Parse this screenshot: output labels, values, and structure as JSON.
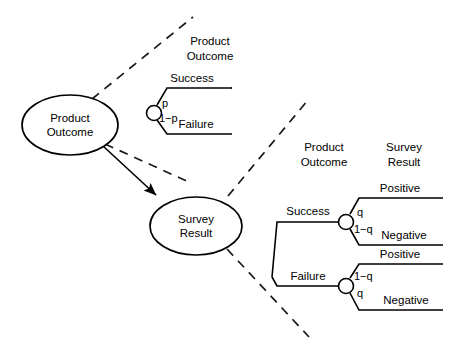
{
  "diagram": {
    "type": "influence-diagram-with-decision-trees",
    "background_color": "#ffffff",
    "line_color": "#000000"
  },
  "influence_nodes": [
    {
      "id": "product-outcome",
      "label_line1": "Product",
      "label_line2": "Outcome",
      "cx": 70,
      "cy": 125,
      "rx": 48,
      "ry": 30
    },
    {
      "id": "survey-result",
      "label_line1": "Survey",
      "label_line2": "Result",
      "cx": 196,
      "cy": 226,
      "rx": 46,
      "ry": 29
    }
  ],
  "influence_arrow": {
    "from": "product-outcome",
    "to": "survey-result",
    "style": "solid-arrow"
  },
  "expansion_links": [
    {
      "id": "link-product-tree-upper",
      "style": "dashed"
    },
    {
      "id": "link-product-tree-lower",
      "style": "dashed"
    },
    {
      "id": "link-survey-tree-upper",
      "style": "dashed"
    },
    {
      "id": "link-survey-tree-lower",
      "style": "dashed"
    }
  ],
  "top_tree": {
    "headers": [
      {
        "id": "top-header-product",
        "line1": "Product",
        "line2": "Outcome"
      }
    ],
    "chance_node": {
      "id": "top-chance-node",
      "shape": "circle"
    },
    "branches": [
      {
        "id": "top-branch-success",
        "probability": "p",
        "outcome": "Success"
      },
      {
        "id": "top-branch-failure",
        "probability": "1−p",
        "outcome": "Failure"
      }
    ]
  },
  "bottom_tree": {
    "headers": [
      {
        "id": "bottom-header-product",
        "line1": "Product",
        "line2": "Outcome"
      },
      {
        "id": "bottom-header-survey",
        "line1": "Survey",
        "line2": "Result"
      }
    ],
    "root_branches": [
      {
        "id": "bottom-branch-success",
        "label": "Success",
        "chance_node": {
          "id": "success-chance-node",
          "shape": "circle"
        },
        "sub_branches": [
          {
            "id": "success-positive",
            "probability": "q",
            "outcome": "Positive"
          },
          {
            "id": "success-negative",
            "probability": "1−q",
            "outcome": "Negative"
          }
        ]
      },
      {
        "id": "bottom-branch-failure",
        "label": "Failure",
        "chance_node": {
          "id": "failure-chance-node",
          "shape": "circle"
        },
        "sub_branches": [
          {
            "id": "failure-positive",
            "probability": "1−q",
            "outcome": "Positive"
          },
          {
            "id": "failure-negative",
            "probability": "q",
            "outcome": "Negative"
          }
        ]
      }
    ]
  }
}
